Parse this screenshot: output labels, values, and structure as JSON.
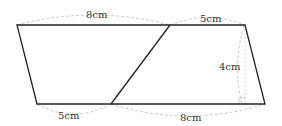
{
  "diagram": {
    "type": "parallelogram-dissection",
    "labels": {
      "top_left_segment": "8cm",
      "top_right_segment": "5cm",
      "height": "4cm",
      "bottom_left_segment": "5cm",
      "bottom_right_segment": "8cm"
    },
    "colors": {
      "outline": "#222222",
      "dashed": "#bbbbbb",
      "text": "#333333"
    }
  }
}
